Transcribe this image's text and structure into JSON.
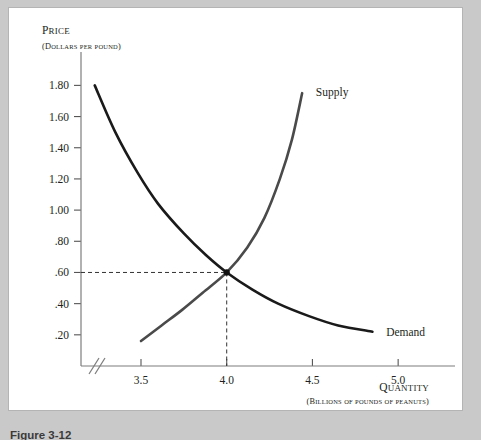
{
  "figure": {
    "caption": "Figure 3-12",
    "frame_color": "#ffffff",
    "page_background": "#c9c9c9"
  },
  "chart_data": {
    "type": "line",
    "title": "",
    "xlabel": "QUANTITY",
    "xlabel_sub": "(BILLIONS OF POUNDS OF PEANUTS)",
    "ylabel": "PRICE",
    "ylabel_sub": "(DOLLARS PER POUND)",
    "xlim": [
      3.15,
      5.25
    ],
    "ylim": [
      0.0,
      1.95
    ],
    "x_ticks": [
      3.5,
      4.0,
      4.5,
      5.0
    ],
    "x_tick_labels": [
      "3.5",
      "4.0",
      "4.5",
      "5.0"
    ],
    "y_ticks": [
      0.2,
      0.4,
      0.6,
      0.8,
      1.0,
      1.2,
      1.4,
      1.6,
      1.8
    ],
    "y_tick_labels": [
      ".20",
      ".40",
      ".60",
      ".80",
      "1.00",
      "1.20",
      "1.40",
      "1.60",
      "1.80"
    ],
    "grid": false,
    "axis_break": true,
    "legend_position": "inline-curve-labels",
    "series": [
      {
        "name": "Demand",
        "label": "Demand",
        "color": "#1a1a1a",
        "width": 2.6,
        "points": [
          [
            3.23,
            1.8
          ],
          [
            3.35,
            1.5
          ],
          [
            3.48,
            1.24
          ],
          [
            3.6,
            1.04
          ],
          [
            3.75,
            0.85
          ],
          [
            3.88,
            0.71
          ],
          [
            4.0,
            0.6
          ],
          [
            4.15,
            0.49
          ],
          [
            4.3,
            0.4
          ],
          [
            4.48,
            0.32
          ],
          [
            4.65,
            0.26
          ],
          [
            4.85,
            0.22
          ]
        ]
      },
      {
        "name": "Supply",
        "label": "Supply",
        "color": "#4a4a4a",
        "width": 2.6,
        "points": [
          [
            3.5,
            0.16
          ],
          [
            3.62,
            0.26
          ],
          [
            3.74,
            0.36
          ],
          [
            3.86,
            0.47
          ],
          [
            4.0,
            0.6
          ],
          [
            4.12,
            0.76
          ],
          [
            4.22,
            0.95
          ],
          [
            4.31,
            1.2
          ],
          [
            4.38,
            1.45
          ],
          [
            4.44,
            1.75
          ]
        ]
      }
    ],
    "equilibrium": {
      "x": 4.0,
      "y": 0.6,
      "marker": "dot",
      "guide_style": "dashed",
      "guide_color": "#333333"
    },
    "annotations": [
      {
        "name": "supply-curve-label",
        "text": "Supply",
        "x": 4.52,
        "y": 1.76
      },
      {
        "name": "demand-curve-label",
        "text": "Demand",
        "x": 4.93,
        "y": 0.22
      }
    ]
  }
}
